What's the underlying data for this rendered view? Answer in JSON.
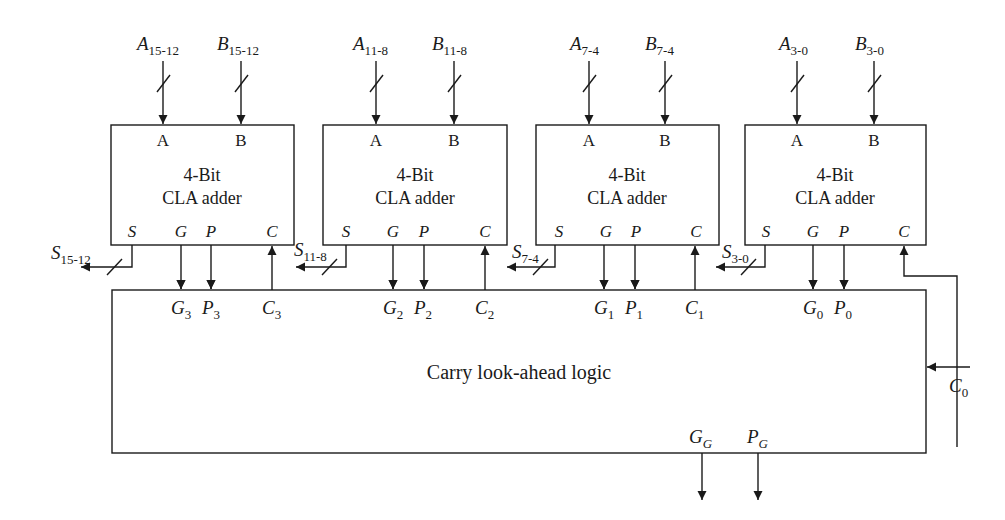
{
  "diagram": {
    "type": "block-diagram",
    "adders": [
      {
        "id": "adder-15-12",
        "title_line1": "4-Bit",
        "title_line2": "CLA adder",
        "port_a": "A",
        "port_b": "B",
        "port_s": "S",
        "port_g": "G",
        "port_p": "P",
        "port_c": "C",
        "input_a": {
          "base": "A",
          "sub": "15-12"
        },
        "input_b": {
          "base": "B",
          "sub": "15-12"
        },
        "sum_out": {
          "base": "S",
          "sub": "15-12"
        },
        "g_sig": {
          "base": "G",
          "sub": "3"
        },
        "p_sig": {
          "base": "P",
          "sub": "3"
        },
        "c_sig": {
          "base": "C",
          "sub": "3"
        }
      },
      {
        "id": "adder-11-8",
        "title_line1": "4-Bit",
        "title_line2": "CLA adder",
        "port_a": "A",
        "port_b": "B",
        "port_s": "S",
        "port_g": "G",
        "port_p": "P",
        "port_c": "C",
        "input_a": {
          "base": "A",
          "sub": "11-8"
        },
        "input_b": {
          "base": "B",
          "sub": "11-8"
        },
        "sum_out": {
          "base": "S",
          "sub": "11-8"
        },
        "g_sig": {
          "base": "G",
          "sub": "2"
        },
        "p_sig": {
          "base": "P",
          "sub": "2"
        },
        "c_sig": {
          "base": "C",
          "sub": "2"
        }
      },
      {
        "id": "adder-7-4",
        "title_line1": "4-Bit",
        "title_line2": "CLA adder",
        "port_a": "A",
        "port_b": "B",
        "port_s": "S",
        "port_g": "G",
        "port_p": "P",
        "port_c": "C",
        "input_a": {
          "base": "A",
          "sub": "7-4"
        },
        "input_b": {
          "base": "B",
          "sub": "7-4"
        },
        "sum_out": {
          "base": "S",
          "sub": "7-4"
        },
        "g_sig": {
          "base": "G",
          "sub": "1"
        },
        "p_sig": {
          "base": "P",
          "sub": "1"
        },
        "c_sig": {
          "base": "C",
          "sub": "1"
        }
      },
      {
        "id": "adder-3-0",
        "title_line1": "4-Bit",
        "title_line2": "CLA adder",
        "port_a": "A",
        "port_b": "B",
        "port_s": "S",
        "port_g": "G",
        "port_p": "P",
        "port_c": "C",
        "input_a": {
          "base": "A",
          "sub": "3-0"
        },
        "input_b": {
          "base": "B",
          "sub": "3-0"
        },
        "sum_out": {
          "base": "S",
          "sub": "3-0"
        },
        "g_sig": {
          "base": "G",
          "sub": "0"
        },
        "p_sig": {
          "base": "P",
          "sub": "0"
        },
        "c_sig": null
      }
    ],
    "cla_logic": {
      "label": "Carry look-ahead logic",
      "carry_in": {
        "base": "C",
        "sub": "0"
      },
      "group_g": {
        "base": "G",
        "sub": "G"
      },
      "group_p": {
        "base": "P",
        "sub": "G"
      }
    }
  }
}
